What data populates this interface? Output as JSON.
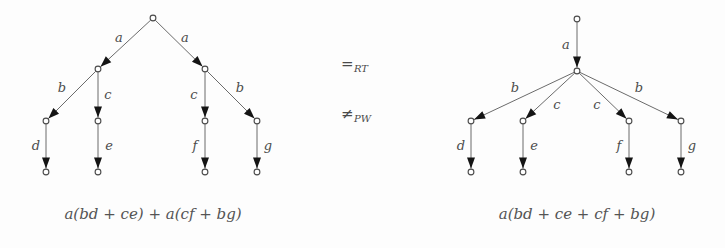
{
  "figure": {
    "background_color": "#fdfdfd",
    "edge_color": "#6b6b6b",
    "arrow_color": "#141414",
    "node_stroke_color": "#4a4a4a",
    "label_color": "#4c4c4c"
  },
  "left_tree": {
    "name": "left-process-tree",
    "caption": "a(bd + ce) + a(cf + bg)",
    "nodes": [
      {
        "id": "root",
        "x": 153,
        "y": 18,
        "label": ""
      },
      {
        "id": "l1",
        "x": 98,
        "y": 69,
        "label": ""
      },
      {
        "id": "r1",
        "x": 205,
        "y": 69,
        "label": ""
      },
      {
        "id": "l2a",
        "x": 46,
        "y": 121,
        "label": ""
      },
      {
        "id": "l2b",
        "x": 98,
        "y": 121,
        "label": ""
      },
      {
        "id": "r2a",
        "x": 205,
        "y": 121,
        "label": ""
      },
      {
        "id": "r2b",
        "x": 257,
        "y": 121,
        "label": ""
      },
      {
        "id": "l3a",
        "x": 46,
        "y": 172,
        "label": ""
      },
      {
        "id": "l3b",
        "x": 98,
        "y": 172,
        "label": ""
      },
      {
        "id": "r3a",
        "x": 205,
        "y": 172,
        "label": ""
      },
      {
        "id": "r3b",
        "x": 257,
        "y": 172,
        "label": ""
      }
    ],
    "edges": [
      {
        "from": "root",
        "to": "l1",
        "label": "a",
        "lx": 119,
        "ly": 38
      },
      {
        "from": "root",
        "to": "r1",
        "label": "a",
        "lx": 185,
        "ly": 38
      },
      {
        "from": "l1",
        "to": "l2a",
        "label": "b",
        "lx": 62,
        "ly": 88
      },
      {
        "from": "l1",
        "to": "l2b",
        "label": "c",
        "lx": 108,
        "ly": 95
      },
      {
        "from": "r1",
        "to": "r2a",
        "label": "c",
        "lx": 194,
        "ly": 95
      },
      {
        "from": "r1",
        "to": "r2b",
        "label": "b",
        "lx": 240,
        "ly": 88
      },
      {
        "from": "l2a",
        "to": "l3a",
        "label": "d",
        "lx": 36,
        "ly": 146
      },
      {
        "from": "l2b",
        "to": "l3b",
        "label": "e",
        "lx": 109,
        "ly": 146
      },
      {
        "from": "r2a",
        "to": "r3a",
        "label": "f",
        "lx": 195,
        "ly": 146
      },
      {
        "from": "r2b",
        "to": "r3b",
        "label": "g",
        "lx": 268,
        "ly": 146
      }
    ]
  },
  "right_tree": {
    "name": "right-process-tree",
    "caption": "a(bd + ce + cf + bg)",
    "nodes": [
      {
        "id": "root",
        "x": 577,
        "y": 19,
        "label": ""
      },
      {
        "id": "hub",
        "x": 577,
        "y": 71,
        "label": ""
      },
      {
        "id": "n1",
        "x": 471,
        "y": 121,
        "label": ""
      },
      {
        "id": "n2",
        "x": 523,
        "y": 121,
        "label": ""
      },
      {
        "id": "n3",
        "x": 629,
        "y": 121,
        "label": ""
      },
      {
        "id": "n4",
        "x": 681,
        "y": 121,
        "label": ""
      },
      {
        "id": "m1",
        "x": 471,
        "y": 172,
        "label": ""
      },
      {
        "id": "m2",
        "x": 523,
        "y": 172,
        "label": ""
      },
      {
        "id": "m3",
        "x": 629,
        "y": 172,
        "label": ""
      },
      {
        "id": "m4",
        "x": 681,
        "y": 172,
        "label": ""
      }
    ],
    "edges": [
      {
        "from": "root",
        "to": "hub",
        "label": "a",
        "lx": 566,
        "ly": 45
      },
      {
        "from": "hub",
        "to": "n1",
        "label": "b",
        "lx": 515,
        "ly": 88
      },
      {
        "from": "hub",
        "to": "n2",
        "label": "c",
        "lx": 557,
        "ly": 105
      },
      {
        "from": "hub",
        "to": "n3",
        "label": "c",
        "lx": 597,
        "ly": 105
      },
      {
        "from": "hub",
        "to": "n4",
        "label": "b",
        "lx": 639,
        "ly": 88
      },
      {
        "from": "n1",
        "to": "m1",
        "label": "d",
        "lx": 461,
        "ly": 146
      },
      {
        "from": "n2",
        "to": "m2",
        "label": "e",
        "lx": 534,
        "ly": 146
      },
      {
        "from": "n3",
        "to": "m3",
        "label": "f",
        "lx": 619,
        "ly": 146
      },
      {
        "from": "n4",
        "to": "m4",
        "label": "g",
        "lx": 692,
        "ly": 146
      }
    ]
  },
  "relations": [
    {
      "name": "equals-rt",
      "symbol": "=",
      "subscript": "RT",
      "x": 341,
      "y": 65
    },
    {
      "name": "not-equals-pw",
      "symbol": "≠",
      "subscript": "PW",
      "x": 341,
      "y": 115
    }
  ],
  "captions": [
    {
      "name": "left-caption",
      "text": "a(bd + ce) + a(cf + bg)",
      "x": 153,
      "y": 215
    },
    {
      "name": "right-caption",
      "text": "a(bd + ce + cf + bg)",
      "x": 577,
      "y": 215
    }
  ]
}
